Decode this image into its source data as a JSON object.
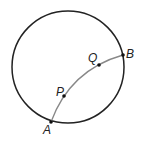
{
  "diagram": {
    "circle": {
      "cx": 68,
      "cy": 67,
      "r": 56,
      "stroke": "#222"
    },
    "arc": {
      "from": "A",
      "to": "B",
      "stroke": "#888"
    },
    "points": [
      {
        "label": "A",
        "x": 51,
        "y": 122,
        "lx": 43,
        "ly": 134
      },
      {
        "label": "P",
        "x": 64,
        "y": 96,
        "lx": 55,
        "ly": 95
      },
      {
        "label": "Q",
        "x": 99,
        "y": 65,
        "lx": 87,
        "ly": 62
      },
      {
        "label": "B",
        "x": 123,
        "y": 55,
        "lx": 126,
        "ly": 57
      }
    ]
  }
}
